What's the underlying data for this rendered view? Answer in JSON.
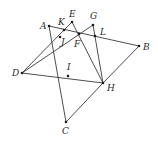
{
  "figure": {
    "type": "geometry-diagram",
    "points": [
      {
        "name": "A",
        "x": 49,
        "y": 26,
        "lx": 40,
        "ly": 29
      },
      {
        "name": "K",
        "x": 64,
        "y": 30,
        "lx": 58,
        "ly": 25
      },
      {
        "name": "E",
        "x": 72,
        "y": 22,
        "lx": 69,
        "ly": 17
      },
      {
        "name": "G",
        "x": 93,
        "y": 25,
        "lx": 90,
        "ly": 19
      },
      {
        "name": "L",
        "x": 95,
        "y": 36,
        "lx": 100,
        "ly": 35
      },
      {
        "name": "B",
        "x": 139,
        "y": 46,
        "lx": 143,
        "ly": 50
      },
      {
        "name": "J",
        "x": 60,
        "y": 37,
        "lx": 61,
        "ly": 45
      },
      {
        "name": "F",
        "x": 79,
        "y": 34,
        "lx": 74,
        "ly": 47
      },
      {
        "name": "D",
        "x": 22,
        "y": 73,
        "lx": 12,
        "ly": 76
      },
      {
        "name": "I",
        "x": 68,
        "y": 76,
        "lx": 67,
        "ly": 70
      },
      {
        "name": "H",
        "x": 103,
        "y": 83,
        "lx": 107,
        "ly": 91
      },
      {
        "name": "C",
        "x": 66,
        "y": 122,
        "lx": 62,
        "ly": 134
      }
    ],
    "segments": [
      [
        "A",
        "B"
      ],
      [
        "A",
        "C"
      ],
      [
        "C",
        "H"
      ],
      [
        "H",
        "B"
      ],
      [
        "D",
        "H"
      ],
      [
        "D",
        "K"
      ],
      [
        "D",
        "G"
      ],
      [
        "E",
        "H"
      ],
      [
        "G",
        "H"
      ],
      [
        "K",
        "E"
      ]
    ]
  }
}
